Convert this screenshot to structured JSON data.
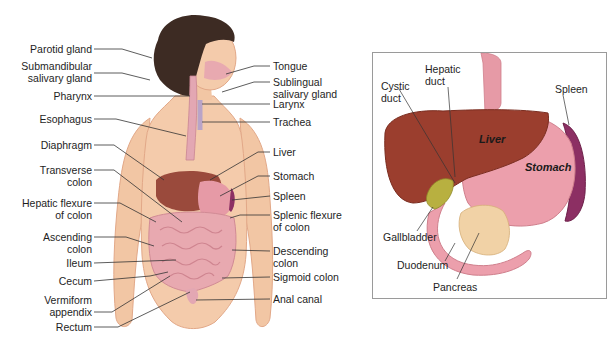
{
  "left_figure": {
    "title": "Digestive system (full body)",
    "labels_left": [
      {
        "text": "Parotid gland"
      },
      {
        "text": "Submandibular\nsalivary gland"
      },
      {
        "text": "Pharynx"
      },
      {
        "text": "Esophagus"
      },
      {
        "text": "Diaphragm"
      },
      {
        "text": "Transverse\ncolon"
      },
      {
        "text": "Hepatic flexure\nof colon"
      },
      {
        "text": "Ascending\ncolon"
      },
      {
        "text": "Ileum"
      },
      {
        "text": "Cecum"
      },
      {
        "text": "Vermiform\nappendix"
      },
      {
        "text": "Rectum"
      }
    ],
    "labels_right": [
      {
        "text": "Tongue"
      },
      {
        "text": "Sublingual\nsalivary gland"
      },
      {
        "text": "Larynx"
      },
      {
        "text": "Trachea"
      },
      {
        "text": "Liver"
      },
      {
        "text": "Stomach"
      },
      {
        "text": "Spleen"
      },
      {
        "text": "Splenic flexure\nof colon"
      },
      {
        "text": "Descending\ncolon"
      },
      {
        "text": "Sigmoid colon"
      },
      {
        "text": "Anal canal"
      }
    ]
  },
  "right_figure": {
    "title": "Liver, stomach and associated organs",
    "labels": {
      "cystic_duct": "Cystic\nduct",
      "hepatic_duct": "Hepatic\nduct",
      "spleen": "Spleen",
      "gallbladder": "Gallbladder",
      "duodenum": "Duodenum",
      "pancreas": "Pancreas"
    },
    "organ_labels": {
      "liver": "Liver",
      "stomach": "Stomach"
    }
  },
  "colors": {
    "skin": "#f2c6a4",
    "skin_shade": "#e3a582",
    "hair": "#3a2a22",
    "liver": "#9a3b2a",
    "stomach": "#e69aa6",
    "intestine": "#e8a9b0",
    "spleen": "#8c2f63",
    "gallbladder": "#b8b040",
    "pancreas": "#f1d2a6",
    "esophagus": "#e3a7b3",
    "leader_line": "#333333"
  }
}
